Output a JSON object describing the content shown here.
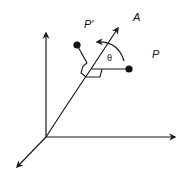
{
  "diagram": {
    "title": "",
    "labels": {
      "axis_a": "A",
      "point_p_prime": "P'",
      "point_p": "P",
      "angle": "θ"
    },
    "colors": {
      "stroke": "#1a1a1a",
      "background": "#ffffff"
    },
    "elements": [
      {
        "type": "axis",
        "name": "vertical-axis"
      },
      {
        "type": "axis",
        "name": "horizontal-axis"
      },
      {
        "type": "axis",
        "name": "depth-axis"
      },
      {
        "type": "axis",
        "name": "rotation-axis",
        "label": "A"
      },
      {
        "type": "point",
        "name": "point-p",
        "label": "P"
      },
      {
        "type": "point",
        "name": "point-p-prime",
        "label": "P'"
      },
      {
        "type": "arc-arrow",
        "name": "rotation-arrow",
        "label": "θ"
      }
    ]
  }
}
